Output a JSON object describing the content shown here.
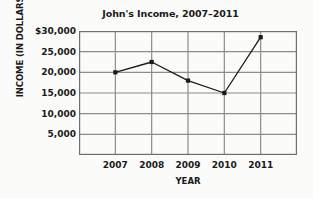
{
  "chart_data": {
    "type": "line",
    "title": "John's Income, 2007–2011",
    "xlabel": "YEAR",
    "ylabel": "INCOME (IN DOLLARS)",
    "categories": [
      "2007",
      "2008",
      "2009",
      "2010",
      "2011"
    ],
    "values": [
      20000,
      22500,
      18000,
      15000,
      28500
    ],
    "x": [
      2007,
      2008,
      2009,
      2010,
      2011
    ],
    "series": [
      {
        "name": "Income",
        "values": [
          20000,
          22500,
          18000,
          15000,
          28500
        ]
      }
    ],
    "ylim": [
      0,
      30000
    ],
    "ytick_values": [
      30000,
      25000,
      20000,
      15000,
      10000,
      5000
    ],
    "ytick_labels": [
      "$30,000",
      "25,000",
      "20,000",
      "15,000",
      "10,000",
      "5,000"
    ],
    "xtick_labels": [
      "2007",
      "2008",
      "2009",
      "2010",
      "2011"
    ],
    "grid": true,
    "legend": "none",
    "marker": "filled-square",
    "line_color": "#1a1a1a",
    "grid_color": "#8c8c8c",
    "axis_color": "#6e6e6e",
    "background_color": "#fbfbf9"
  },
  "figure": {
    "title": "John's Income, 2007–2011",
    "y_axis_title": "INCOME (IN DOLLARS)",
    "x_axis_title": "YEAR"
  }
}
